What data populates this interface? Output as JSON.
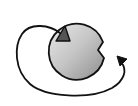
{
  "icon": {
    "semantic": "cycle-refill-icon",
    "description": "Gray circle with a wedge notch, dark triangle inside, curved arrow looping from triangle back to notch",
    "colors": {
      "background": "#ffffff",
      "outline": "#111111",
      "circle_fill_light": "#e6e6e6",
      "circle_fill_dark": "#9a9a9a",
      "triangle_fill": "#555555",
      "arrow_stroke": "#111111"
    }
  }
}
